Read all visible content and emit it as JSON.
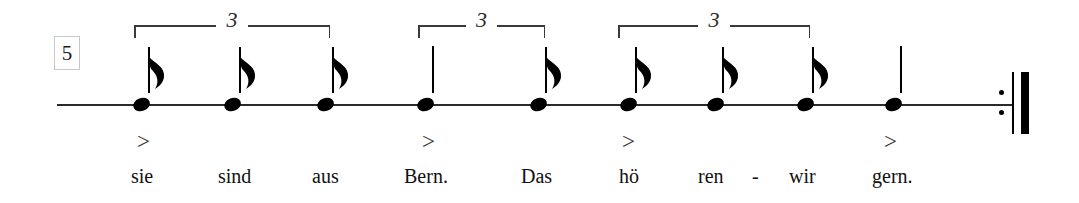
{
  "staff": {
    "measure_number": "5",
    "line_start_x": 57,
    "line_end_x": 1014,
    "line_y": 104
  },
  "notes": [
    {
      "id": "note-1",
      "x": 133,
      "type": "eighth",
      "flag": true,
      "stem_height": 46,
      "lyric": "sie",
      "lyric_x": 131,
      "accent": true,
      "accent_x": 137
    },
    {
      "id": "note-2",
      "x": 224,
      "type": "eighth",
      "flag": true,
      "stem_height": 46,
      "lyric": "sind",
      "lyric_x": 218,
      "accent": false,
      "accent_x": 0
    },
    {
      "id": "note-3",
      "x": 317,
      "type": "eighth",
      "flag": true,
      "stem_height": 46,
      "lyric": "aus",
      "lyric_x": 312,
      "accent": false,
      "accent_x": 0
    },
    {
      "id": "note-4",
      "x": 417,
      "type": "quarter",
      "flag": false,
      "stem_height": 47,
      "lyric": "Bern.",
      "lyric_x": 404,
      "accent": true,
      "accent_x": 422
    },
    {
      "id": "note-5",
      "x": 530,
      "type": "eighth",
      "flag": true,
      "stem_height": 46,
      "lyric": "Das",
      "lyric_x": 521,
      "accent": false,
      "accent_x": 0
    },
    {
      "id": "note-6",
      "x": 620,
      "type": "eighth",
      "flag": true,
      "stem_height": 46,
      "lyric": "hö",
      "lyric_x": 619,
      "accent": true,
      "accent_x": 622
    },
    {
      "id": "note-7",
      "x": 707,
      "type": "eighth",
      "flag": true,
      "stem_height": 46,
      "lyric": "ren",
      "lyric_x": 698,
      "accent": false,
      "accent_x": 0
    },
    {
      "id": "note-8",
      "x": 797,
      "type": "eighth",
      "flag": true,
      "stem_height": 46,
      "lyric": "wir",
      "lyric_x": 789,
      "accent": false,
      "accent_x": 0
    },
    {
      "id": "note-9",
      "x": 885,
      "type": "quarter",
      "flag": false,
      "stem_height": 47,
      "lyric": "gern.",
      "lyric_x": 872,
      "accent": true,
      "accent_x": 884
    }
  ],
  "hyphens": [
    {
      "text": "-",
      "x": 752
    }
  ],
  "triplets": [
    {
      "id": "triplet-1",
      "label": "3",
      "x": 134,
      "width": 196,
      "y": 25
    },
    {
      "id": "triplet-2",
      "label": "3",
      "x": 418,
      "width": 127,
      "y": 25
    },
    {
      "id": "triplet-3",
      "label": "3",
      "x": 618,
      "width": 192,
      "y": 25
    }
  ],
  "barline": {
    "type": "end-repeat",
    "dots_x": 999,
    "dot_top_y": 90,
    "dot_bottom_y": 110,
    "thin_x": 1012,
    "thick_x": 1021,
    "top_y": 72,
    "height": 62
  },
  "lyrics_baseline_y": 166,
  "accent_y": 130,
  "colors": {
    "ink": "#000000",
    "staff": "#2a2a2a",
    "bracket": "#3a3a3a",
    "measure_box_border": "#c8c8c8",
    "background": "#ffffff"
  }
}
